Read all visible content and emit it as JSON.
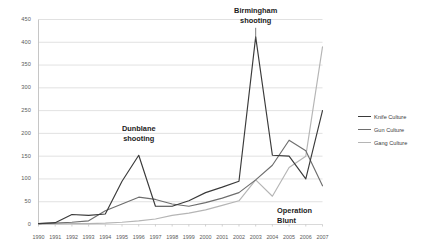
{
  "chart_data": {
    "type": "line",
    "title": "",
    "xlabel": "",
    "ylabel": "",
    "ylim": [
      0,
      450
    ],
    "ytick_step": 50,
    "grid": true,
    "legend_position": "right",
    "x": [
      "1990",
      "1991",
      "1992",
      "1993",
      "1994",
      "1995",
      "1996",
      "1997",
      "1998",
      "1999",
      "2000",
      "2001",
      "2002",
      "2003",
      "2004",
      "2005",
      "2006",
      "2007"
    ],
    "yticks": [
      "450",
      "400",
      "350",
      "300",
      "250",
      "200",
      "150",
      "100",
      "50",
      "0"
    ],
    "series": [
      {
        "name": "Knife Culture",
        "color": "#3a3a3a",
        "values": [
          2,
          4,
          22,
          20,
          23,
          95,
          152,
          40,
          40,
          52,
          70,
          82,
          95,
          412,
          152,
          150,
          100,
          250
        ]
      },
      {
        "name": "Gun Culture",
        "color": "#6e6e6e",
        "values": [
          2,
          3,
          5,
          8,
          30,
          45,
          60,
          55,
          45,
          40,
          48,
          58,
          70,
          98,
          130,
          185,
          162,
          85
        ]
      },
      {
        "name": "Gang Culture",
        "color": "#b5b5b5",
        "values": [
          1,
          1,
          2,
          2,
          3,
          5,
          8,
          12,
          20,
          25,
          32,
          42,
          52,
          98,
          62,
          125,
          150,
          390
        ]
      }
    ],
    "annotations": [
      {
        "text_line1": "Birmingham",
        "text_line2": "shooting",
        "x_year": "2003",
        "value": 412
      },
      {
        "text_line1": "Dunblane",
        "text_line2": "shooting",
        "x_year": "1996",
        "value": 152
      },
      {
        "text_line1": "Operation",
        "text_line2": "Blunt",
        "x_year": "2005",
        "value": 125
      }
    ]
  },
  "legend": {
    "items": [
      {
        "label": "Knife Culture"
      },
      {
        "label": "Gun Culture"
      },
      {
        "label": "Gang Culture"
      }
    ]
  },
  "annotations": {
    "birmingham": {
      "line1": "Birmingham",
      "line2": "shooting"
    },
    "dunblane": {
      "line1": "Dunblane",
      "line2": "shooting"
    },
    "blunt": {
      "line1": "Operation",
      "line2": "Blunt"
    }
  },
  "colors": {
    "knife": "#3a3a3a",
    "gun": "#6e6e6e",
    "gang": "#b5b5b5",
    "grid": "#d9d9d9",
    "axis": "#bfbfbf",
    "tick_text": "#5a5a5a"
  }
}
